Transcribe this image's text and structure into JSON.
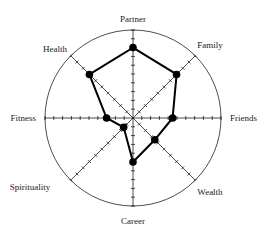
{
  "chart_data": {
    "type": "radar",
    "title": "",
    "categories": [
      "Partner",
      "Family",
      "Friends",
      "Wealth",
      "Career",
      "Spirituality",
      "Fitness",
      "Health"
    ],
    "values": [
      8,
      7,
      4.5,
      3.5,
      5,
      1.5,
      3,
      7
    ],
    "scale": {
      "min": 0,
      "max": 10,
      "ticks": 10
    },
    "grid": {
      "outer_circle": true,
      "spokes": 8
    },
    "series": [
      {
        "name": "Wheel of Life",
        "values": [
          8,
          7,
          4.5,
          3.5,
          5,
          1.5,
          3,
          7
        ],
        "color": "#000000"
      }
    ]
  },
  "colors": {
    "line": "#000000",
    "axis": "#000000",
    "text": "#222222",
    "background": "#ffffff"
  }
}
